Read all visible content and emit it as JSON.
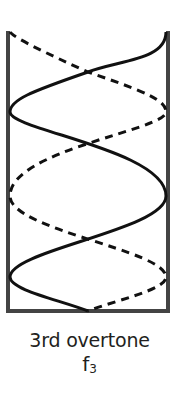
{
  "diagram": {
    "title": "3rd overtone",
    "symbol": "f",
    "subscript": "3",
    "colors": {
      "tube_walls": "#444444",
      "wave_solid": "#111111",
      "wave_dashed": "#111111",
      "background": "#ffffff",
      "text": "#231f20"
    },
    "tube": {
      "left_x": 7,
      "right_x": 168,
      "top_y": 32,
      "bottom_y": 311,
      "closed_end": "bottom",
      "open_end": "top"
    },
    "nodes_count": 4,
    "antinodes_count": 4
  }
}
